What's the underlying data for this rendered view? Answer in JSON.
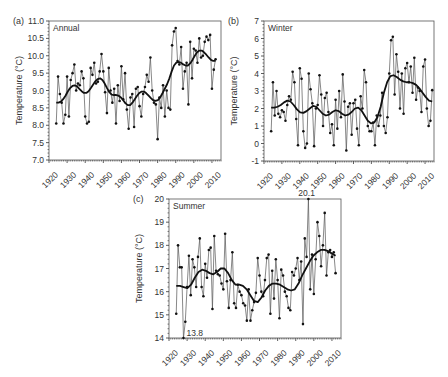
{
  "chart_data": [
    {
      "id": "a",
      "type": "line",
      "panel_label": "(a)",
      "title": "Annual",
      "xlabel": "",
      "ylabel": "Temperature (°C)",
      "ylim": [
        7.0,
        11.0
      ],
      "yticks": [
        7.0,
        7.5,
        8.0,
        8.5,
        9.0,
        9.5,
        10.0,
        10.5,
        11.0
      ],
      "ytick_labels": [
        "7.0",
        "7.5",
        "8.0",
        "8.5",
        "9.0",
        "9.5",
        "10.0",
        "10.5",
        "11.0"
      ],
      "xlim": [
        1920,
        2015
      ],
      "xticks": [
        1920,
        1930,
        1940,
        1950,
        1960,
        1970,
        1980,
        1990,
        2000,
        2010
      ],
      "grid": false,
      "box": {
        "left": 49,
        "top": 21,
        "right": 221,
        "bottom": 160
      },
      "x_start": 1924,
      "series": [
        {
          "name": "observed",
          "values": [
            8.05,
            9.4,
            8.9,
            8.65,
            8.05,
            8.3,
            9.4,
            8.25,
            9.3,
            9.5,
            9.75,
            9.0,
            9.2,
            9.15,
            9.55,
            9.35,
            8.25,
            8.05,
            8.1,
            9.65,
            9.45,
            9.8,
            9.2,
            9.25,
            9.55,
            10.05,
            9.55,
            8.95,
            8.35,
            9.65,
            9.0,
            8.65,
            9.05,
            8.05,
            9.15,
            8.7,
            9.7,
            8.75,
            9.5,
            8.45,
            7.9,
            8.8,
            8.9,
            7.95,
            9.05,
            9.1,
            8.55,
            8.25,
            8.9,
            9.1,
            9.45,
            9.25,
            9.95,
            9.0,
            8.65,
            8.6,
            7.6,
            8.8,
            8.5,
            9.15,
            8.25,
            9.0,
            8.5,
            8.45,
            10.3,
            10.7,
            10.8,
            9.85,
            9.75,
            10.25,
            9.05,
            9.55,
            9.8,
            8.6,
            10.4,
            9.35,
            10.2,
            10.15,
            9.8,
            10.5,
            9.95,
            10.0,
            10.4,
            10.55,
            10.45,
            10.6,
            9.05,
            9.6,
            9.9
          ]
        },
        {
          "name": "smoothed",
          "values": [
            8.65,
            8.65,
            8.68,
            8.75,
            8.85,
            8.97,
            9.07,
            9.13,
            9.15,
            9.12,
            9.05,
            8.98,
            8.93,
            8.93,
            8.98,
            9.07,
            9.17,
            9.27,
            9.33,
            9.35,
            9.3,
            9.2,
            9.07,
            8.95,
            8.88,
            8.87,
            8.87,
            8.85,
            8.8,
            8.72,
            8.63,
            8.58,
            8.58,
            8.65,
            8.75,
            8.85,
            8.93,
            8.97,
            8.97,
            8.92,
            8.85,
            8.78,
            8.72,
            8.7,
            8.72,
            8.8,
            8.92,
            9.05,
            9.18,
            9.35,
            9.55,
            9.72,
            9.8,
            9.82,
            9.8,
            9.75,
            9.72,
            9.72,
            9.78,
            9.88,
            10.0,
            10.1,
            10.15,
            10.15,
            10.1,
            10.03,
            9.95,
            9.88,
            9.85,
            9.85
          ]
        }
      ]
    },
    {
      "id": "b",
      "type": "line",
      "panel_label": "(b)",
      "title": "Winter",
      "xlabel": "",
      "ylabel": "Temperature (°C)",
      "ylim": [
        -1,
        7
      ],
      "yticks": [
        -1,
        0,
        1,
        2,
        3,
        4,
        5,
        6,
        7
      ],
      "ytick_labels": [
        "-1",
        "0",
        "1",
        "2",
        "3",
        "4",
        "5",
        "6",
        "7"
      ],
      "xlim": [
        1920,
        2015
      ],
      "xticks": [
        1920,
        1930,
        1940,
        1950,
        1960,
        1970,
        1980,
        1990,
        2000,
        2010
      ],
      "grid": false,
      "box": {
        "left": 264,
        "top": 21,
        "right": 434,
        "bottom": 161
      },
      "x_start": 1924,
      "series": [
        {
          "name": "observed",
          "values": [
            0.7,
            3.5,
            1.6,
            3.0,
            1.7,
            1.5,
            1.9,
            1.8,
            1.3,
            2.2,
            2.7,
            2.5,
            4.1,
            3.5,
            1.4,
            -0.1,
            4.3,
            3.7,
            0.7,
            -0.25,
            0.0,
            4.0,
            3.1,
            2.3,
            -0.15,
            2.0,
            2.2,
            3.9,
            2.8,
            1.0,
            2.6,
            2.9,
            1.8,
            0.6,
            1.1,
            -0.1,
            2.5,
            0.85,
            3.0,
            1.5,
            3.95,
            2.4,
            -0.4,
            2.1,
            2.3,
            0.5,
            2.3,
            2.5,
            0.85,
            -0.1,
            2.7,
            2.0,
            4.2,
            3.5,
            1.0,
            0.7,
            0.7,
            1.2,
            -0.1,
            1.6,
            1.0,
            1.6,
            2.9,
            1.0,
            0.6,
            1.5,
            4.0,
            5.9,
            6.1,
            2.8,
            5.1,
            4.1,
            2.0,
            4.0,
            1.7,
            4.3,
            4.6,
            3.5,
            4.4,
            2.9,
            4.9,
            2.5,
            3.2,
            3.0,
            1.8,
            4.4,
            4.8,
            2.0,
            1.0,
            1.3,
            3.05
          ]
        },
        {
          "name": "smoothed",
          "values": [
            2.05,
            2.05,
            2.1,
            2.2,
            2.35,
            2.45,
            2.4,
            2.2,
            1.95,
            1.78,
            1.75,
            1.85,
            2.0,
            2.15,
            2.1,
            1.9,
            1.7,
            1.6,
            1.65,
            1.8,
            1.9,
            1.85,
            1.7,
            1.6,
            1.65,
            1.8,
            2.0,
            2.05,
            1.9,
            1.6,
            1.3,
            1.15,
            1.2,
            1.5,
            2.1,
            2.9,
            3.5,
            3.85,
            3.9,
            3.8,
            3.65,
            3.55,
            3.5,
            3.5,
            3.45,
            3.35,
            3.15,
            2.9,
            2.65,
            2.45,
            2.4
          ]
        }
      ]
    },
    {
      "id": "c",
      "type": "line",
      "panel_label": "(c)",
      "title": "Summer",
      "xlabel": "",
      "ylabel": "Temperature (°C)",
      "ylim": [
        14,
        20
      ],
      "yticks": [
        14,
        15,
        16,
        17,
        18,
        19,
        20
      ],
      "ytick_labels": [
        "14",
        "15",
        "16",
        "17",
        "18",
        "19",
        "20"
      ],
      "xlim": [
        1920,
        2015
      ],
      "xticks": [
        1920,
        1930,
        1940,
        1950,
        1960,
        1970,
        1980,
        1990,
        2000,
        2010
      ],
      "grid": false,
      "box": {
        "left": 169,
        "top": 199,
        "right": 341,
        "bottom": 338
      },
      "x_start": 1924,
      "annotations": [
        {
          "text": "20.1",
          "year": 1996,
          "value": 20.1
        },
        {
          "text": "13.8",
          "year": 1928,
          "value": 13.8
        }
      ],
      "series": [
        {
          "name": "observed",
          "values": [
            15.05,
            18.0,
            17.05,
            17.05,
            13.8,
            14.7,
            16.2,
            17.55,
            15.85,
            17.4,
            17.05,
            16.2,
            17.5,
            18.3,
            16.2,
            15.8,
            17.2,
            16.6,
            17.8,
            17.9,
            15.25,
            18.4,
            16.9,
            16.75,
            16.7,
            16.35,
            16.1,
            18.5,
            16.45,
            15.3,
            16.5,
            17.7,
            15.5,
            15.3,
            16.3,
            16.0,
            15.85,
            15.5,
            15.4,
            14.75,
            16.1,
            14.75,
            15.2,
            15.55,
            15.95,
            17.45,
            16.7,
            16.0,
            15.8,
            16.5,
            17.45,
            17.6,
            15.05,
            16.9,
            15.7,
            17.4,
            16.5,
            14.85,
            16.95,
            16.7,
            16.0,
            15.8,
            15.3,
            15.2,
            16.85,
            16.7,
            17.0,
            17.45,
            16.5,
            17.3,
            14.6,
            18.3,
            17.5,
            20.1,
            16.1,
            17.6,
            15.9,
            17.4,
            19.0,
            18.4,
            17.1,
            18.0,
            19.4,
            16.7,
            17.7,
            17.8,
            17.5,
            17.7,
            16.8
          ]
        },
        {
          "name": "smoothed",
          "values": [
            16.25,
            16.25,
            16.2,
            16.15,
            16.3,
            16.6,
            16.85,
            16.95,
            16.9,
            16.8,
            16.75,
            16.85,
            17.0,
            17.0,
            16.8,
            16.5,
            16.3,
            16.3,
            16.25,
            16.1,
            15.85,
            15.6,
            15.55,
            15.75,
            16.05,
            16.25,
            16.35,
            16.35,
            16.3,
            16.2,
            16.1,
            16.05,
            16.1,
            16.35,
            16.7,
            17.0,
            17.3,
            17.55,
            17.7,
            17.8,
            17.8,
            17.75,
            17.65,
            17.55
          ]
        }
      ]
    }
  ]
}
